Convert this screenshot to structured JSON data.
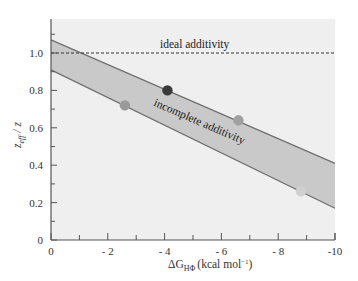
{
  "chart_data": {
    "type": "scatter",
    "title": "",
    "xlabel": "ΔG_HΦ (kcal mol⁻¹)",
    "xlabel_main": "ΔG",
    "xlabel_sub": "HΦ",
    "xlabel_unit": "(kcal mol",
    "xlabel_unit_sup": "−1",
    "xlabel_unit_close": ")",
    "ylabel": "z_eff / z",
    "ylabel_main": "z",
    "ylabel_sub": "eff",
    "ylabel_rest": " / z",
    "xlim": [
      0,
      -10
    ],
    "ylim": [
      0,
      1.15
    ],
    "x_ticks": [
      0,
      -2,
      -4,
      -6,
      -8,
      -10
    ],
    "x_tick_labels": [
      "0",
      "- 2",
      "- 4",
      "- 6",
      "- 8",
      "-10"
    ],
    "y_ticks": [
      0,
      0.2,
      0.4,
      0.6,
      0.8,
      1.0
    ],
    "y_tick_labels": [
      "0",
      "0.2",
      "0.4",
      "0.6",
      "0.8",
      "1.0"
    ],
    "grid": false,
    "reference_line": {
      "y": 1.0,
      "style": "dashed",
      "label": "ideal additivity"
    },
    "band": {
      "label": "incomplete additivity",
      "upper": [
        [
          0,
          1.07
        ],
        [
          -10,
          0.41
        ]
      ],
      "lower": [
        [
          0,
          0.91
        ],
        [
          -10,
          0.17
        ]
      ],
      "fill": "#c9c9c9",
      "edge": "#707070"
    },
    "points": [
      {
        "x": -2.6,
        "y": 0.72,
        "color": "#9a9a9a"
      },
      {
        "x": -4.1,
        "y": 0.8,
        "color": "#3a3a3a"
      },
      {
        "x": -6.6,
        "y": 0.64,
        "color": "#a0a0a0"
      },
      {
        "x": -8.8,
        "y": 0.26,
        "color": "#d0d0d0"
      }
    ],
    "background": "#efefef"
  }
}
